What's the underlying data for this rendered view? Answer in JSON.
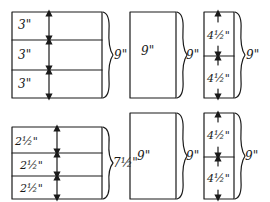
{
  "diagram": {
    "top_row": {
      "stack_of_three": {
        "segments": [
          "3\"",
          "3\"",
          "3\""
        ],
        "total": "9\""
      },
      "single_block": {
        "label": "9\"",
        "total": "9\""
      },
      "stack_of_two": {
        "segments": [
          "4½\"",
          "4½\""
        ],
        "total": "9\""
      }
    },
    "bottom_row": {
      "stack_of_three": {
        "segments": [
          "2½\"",
          "2½\"",
          "2½\""
        ],
        "total": "7½\""
      },
      "single_block": {
        "label": "9\"",
        "total": "9\""
      },
      "stack_of_two": {
        "segments": [
          "4½\"",
          "4½\""
        ],
        "total": "9\""
      }
    },
    "colors": {
      "ink": "#1a1a1a",
      "paper": "#ffffff"
    }
  }
}
